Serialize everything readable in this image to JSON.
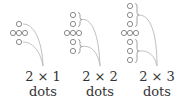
{
  "colors": {
    "dot_stroke": "#8a8a8a",
    "dot_fill": "#ffffff",
    "curve": "#b8b8b8",
    "brace": "#8a8a8a",
    "text": "#333333"
  },
  "figures": [
    {
      "name": "2x1",
      "label_line1": "2 × 1",
      "label_line2": "dots",
      "arm_dots_each_side": 1,
      "braces": false
    },
    {
      "name": "2x2",
      "label_line1": "2 × 2",
      "label_line2": "dots",
      "arm_dots_each_side": 2,
      "braces": true
    },
    {
      "name": "2x3",
      "label_line1": "2 × 3",
      "label_line2": "dots",
      "arm_dots_each_side": 3,
      "braces": true
    }
  ]
}
